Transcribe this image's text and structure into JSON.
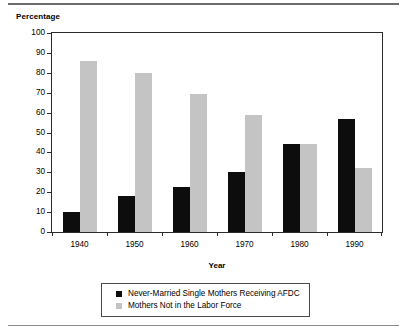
{
  "chart_data": {
    "type": "bar",
    "title": "",
    "xlabel": "Year",
    "ylabel": "Percentage",
    "categories": [
      "1940",
      "1950",
      "1960",
      "1970",
      "1980",
      "1990"
    ],
    "series": [
      {
        "name": "Never-Married Single Mothers Receiving AFDC",
        "color": "#0d0d0d",
        "values": [
          10,
          18,
          22.5,
          30,
          44,
          57
        ]
      },
      {
        "name": "Mothers Not in the Labor Force",
        "color": "#c4c4c4",
        "values": [
          86,
          80,
          69.5,
          59,
          44,
          32
        ]
      }
    ],
    "ylim": [
      0,
      100
    ],
    "yticks": [
      0,
      10,
      20,
      30,
      40,
      50,
      60,
      70,
      80,
      90,
      100
    ],
    "ytick_labels": [
      "0",
      "10",
      "20",
      "30",
      "40",
      "50",
      "60",
      "70",
      "80",
      "90",
      "100"
    ],
    "grid": false,
    "legend_position": "bottom-center"
  }
}
